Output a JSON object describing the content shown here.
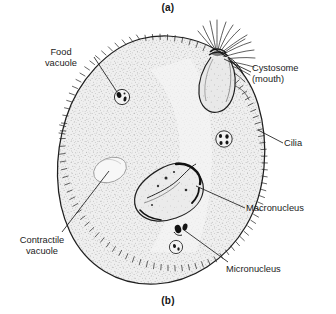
{
  "figure": {
    "panel_a_label": "(a)",
    "panel_b_label": "(b)",
    "background_color": "#ffffff",
    "ink_color": "#1c1c1c",
    "cytoplasm_color": "#efefef"
  },
  "labels": {
    "food_vacuole": "Food\nvacuole",
    "cystosome": "Cystosome\n(mouth)",
    "cilia": "Cilia",
    "macronucleus": "Macronucleus",
    "micronucleus": "Micronucleus",
    "contractile_vacuole": "Contractile\nvacuole"
  },
  "structures": [
    {
      "name": "cell-body",
      "description": "ovoid ciliated cell outline"
    },
    {
      "name": "cytostome",
      "description": "funnel-shaped oral groove at upper right with cilia tuft"
    },
    {
      "name": "macronucleus",
      "description": "large kidney-shaped nucleus at center"
    },
    {
      "name": "micronucleus",
      "description": "small dark body beneath macronucleus"
    },
    {
      "name": "contractile-vacuole",
      "description": "pale oval at left of cell"
    },
    {
      "name": "food-vacuole-upper-left",
      "description": "small round vacuole with dark granules"
    },
    {
      "name": "food-vacuole-right",
      "description": "small round vacuole with dark granules"
    },
    {
      "name": "food-vacuole-lower",
      "description": "small round vacuole with dark granules"
    },
    {
      "name": "cilia-fringe",
      "description": "short hairs around the whole perimeter"
    }
  ]
}
